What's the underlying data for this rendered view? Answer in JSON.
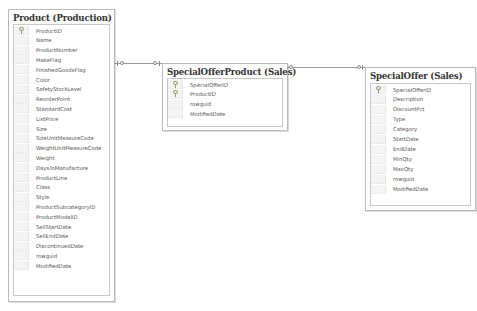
{
  "diagram": {
    "tables": [
      {
        "id": "product",
        "title": "Product (Production)",
        "columns": [
          {
            "name": "ProductID",
            "key": true
          },
          {
            "name": "Name",
            "key": false
          },
          {
            "name": "ProductNumber",
            "key": false
          },
          {
            "name": "MakeFlag",
            "key": false
          },
          {
            "name": "FinishedGoodsFlag",
            "key": false
          },
          {
            "name": "Color",
            "key": false
          },
          {
            "name": "SafetyStockLevel",
            "key": false
          },
          {
            "name": "ReorderPoint",
            "key": false
          },
          {
            "name": "StandardCost",
            "key": false
          },
          {
            "name": "ListPrice",
            "key": false
          },
          {
            "name": "Size",
            "key": false
          },
          {
            "name": "SizeUnitMeasureCode",
            "key": false
          },
          {
            "name": "WeightUnitMeasureCode",
            "key": false
          },
          {
            "name": "Weight",
            "key": false
          },
          {
            "name": "DaysToManufacture",
            "key": false
          },
          {
            "name": "ProductLine",
            "key": false
          },
          {
            "name": "Class",
            "key": false
          },
          {
            "name": "Style",
            "key": false
          },
          {
            "name": "ProductSubcategoryID",
            "key": false
          },
          {
            "name": "ProductModelID",
            "key": false
          },
          {
            "name": "SellStartDate",
            "key": false
          },
          {
            "name": "SellEndDate",
            "key": false
          },
          {
            "name": "DiscontinuedDate",
            "key": false
          },
          {
            "name": "rowguid",
            "key": false
          },
          {
            "name": "ModifiedDate",
            "key": false
          }
        ]
      },
      {
        "id": "special-offer-product",
        "title": "SpecialOfferProduct (Sales)",
        "columns": [
          {
            "name": "SpecialOfferID",
            "key": true
          },
          {
            "name": "ProductID",
            "key": true
          },
          {
            "name": "rowguid",
            "key": false
          },
          {
            "name": "ModifiedDate",
            "key": false
          }
        ]
      },
      {
        "id": "special-offer",
        "title": "SpecialOffer (Sales)",
        "columns": [
          {
            "name": "SpecialOfferID",
            "key": true
          },
          {
            "name": "Description",
            "key": false
          },
          {
            "name": "DiscountPct",
            "key": false
          },
          {
            "name": "Type",
            "key": false
          },
          {
            "name": "Category",
            "key": false
          },
          {
            "name": "StartDate",
            "key": false
          },
          {
            "name": "EndDate",
            "key": false
          },
          {
            "name": "MinQty",
            "key": false
          },
          {
            "name": "MaxQty",
            "key": false
          },
          {
            "name": "rowguid",
            "key": false
          },
          {
            "name": "ModifiedDate",
            "key": false
          }
        ]
      }
    ],
    "relationships": [
      {
        "from": "Product (Production)",
        "to": "SpecialOfferProduct (Sales)"
      },
      {
        "from": "SpecialOfferProduct (Sales)",
        "to": "SpecialOffer (Sales)"
      }
    ]
  }
}
